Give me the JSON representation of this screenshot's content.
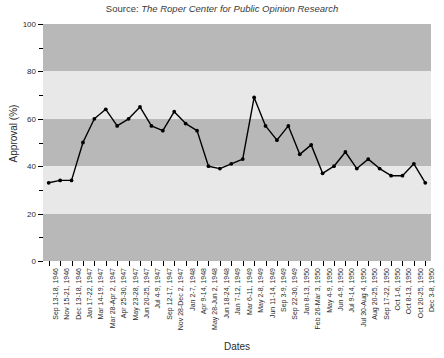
{
  "figure": {
    "source_label": "Source: ",
    "source_text": "The Roper Center for Public Opinion Research"
  },
  "axes": {
    "ylabel": "Approval (%)",
    "xlabel": "Dates",
    "ytick_labels": [
      "0",
      "20",
      "40",
      "60",
      "80",
      "100"
    ]
  },
  "colors": {
    "band_light": "#e8e8e8",
    "band_dark": "#b8b8b8",
    "line": "#000000",
    "marker": "#000000",
    "text": "#2b2b2b"
  },
  "chart_data": {
    "type": "line",
    "title": "Source: The Roper Center for Public Opinion Research",
    "xlabel": "Dates",
    "ylabel": "Approval (%)",
    "ylim": [
      0,
      100
    ],
    "ytick_step": 20,
    "yminor_step": 10,
    "grid": false,
    "legend": "none",
    "series_name": "Presidential approval",
    "categories": [
      "Sep 13-18, 1946",
      "Nov 15-21, 1946",
      "Dec 13-18, 1946",
      "Jan 17-22, 1947",
      "Mar 14-19, 1947",
      "Mar 28-Apr 2, 1947",
      "Apr 25-30, 1947",
      "May 23-28, 1947",
      "Jun 20-25, 1947",
      "Jul 4-9, 1947",
      "Sep 12-17, 1947",
      "Nov 28-Dec 2, 1947",
      "Jan 2-7, 1948",
      "Apr 9-14, 1948",
      "May 28-Jun 2, 1948",
      "Jun 18-24, 1948",
      "Jan 7-12, 1949",
      "Mar 6-11, 1949",
      "May 2-8, 1949",
      "Jun 11-14, 1949",
      "Sep 3-9, 1949",
      "Sep 22-30, 1949",
      "Jan 8-13, 1950",
      "Feb 26-Mar 3, 1950",
      "May 4-9, 1950",
      "Jun 4-9, 1950",
      "Jul 9-14, 1950",
      "Jul 30-Aug 4, 1950",
      "Aug 20-25, 1950",
      "Sep 17-22, 1950",
      "Oct 1-6, 1950",
      "Oct 8-13, 1950",
      "Oct 20-25, 1950",
      "Dec 3-8, 1950"
    ],
    "values": [
      33,
      34,
      34,
      50,
      60,
      64,
      57,
      60,
      65,
      57,
      55,
      63,
      58,
      55,
      40,
      39,
      41,
      43,
      69,
      57,
      51,
      57,
      45,
      49,
      37,
      40,
      46,
      39,
      43,
      39,
      36,
      36,
      41,
      33
    ]
  }
}
